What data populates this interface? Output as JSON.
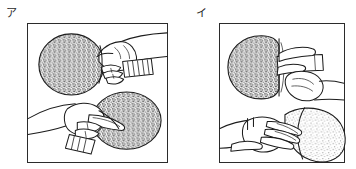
{
  "figure": {
    "caption_type": "instructional-line-art",
    "background_color": "#ffffff",
    "ink_color": "#1c1c1c"
  },
  "panels": [
    {
      "id": "a",
      "label": "ア",
      "label_reading": "a",
      "grip_name": "shakehand-grip",
      "views": [
        {
          "id": "a-top",
          "name": "palm-side-view",
          "blade_shade": "dark-stipple",
          "blade_color": "#6e6e6e",
          "description": "hand gripping handle, fingers wrapped, blade at left"
        },
        {
          "id": "a-bottom",
          "name": "back-side-view",
          "blade_shade": "dark-stipple",
          "blade_color": "#6e6e6e",
          "description": "index finger extended across back of blade"
        }
      ]
    },
    {
      "id": "i",
      "label": "イ",
      "label_reading": "i",
      "grip_name": "penhold-grip",
      "views": [
        {
          "id": "i-top",
          "name": "palm-side-view",
          "blade_shade": "dark-stipple",
          "blade_color": "#6b6b6b",
          "description": "thumb and index pinching short handle, blade at left"
        },
        {
          "id": "i-bottom",
          "name": "back-side-view",
          "blade_shade": "light-stipple",
          "blade_color": "#9f9f9f",
          "description": "curled fingers resting on back of blade"
        }
      ]
    }
  ]
}
